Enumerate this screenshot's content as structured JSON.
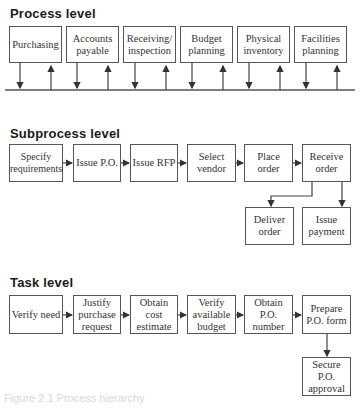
{
  "process_level": {
    "heading": "Process level",
    "boxes": [
      {
        "label": "Purchasing"
      },
      {
        "label": "Accounts payable"
      },
      {
        "label": "Receiving/ inspection"
      },
      {
        "label": "Budget planning"
      },
      {
        "label": "Physical inventory"
      },
      {
        "label": "Facilities planning"
      }
    ]
  },
  "subprocess_level": {
    "heading": "Subprocess level",
    "boxes": [
      {
        "label": "Specify requirements"
      },
      {
        "label": "Issue P.O."
      },
      {
        "label": "Issue RFP"
      },
      {
        "label": "Select vendor"
      },
      {
        "label": "Place order"
      },
      {
        "label": "Receive order"
      },
      {
        "label": "Deliver order"
      },
      {
        "label": "Issue payment"
      }
    ]
  },
  "task_level": {
    "heading": "Task level",
    "boxes": [
      {
        "label": "Verify need"
      },
      {
        "label": "Justify purchase request"
      },
      {
        "label": "Obtain cost estimate"
      },
      {
        "label": "Verify available budget"
      },
      {
        "label": "Obtain P.O. number"
      },
      {
        "label": "Prepare P.O. form"
      },
      {
        "label": "Secure P.O. approval"
      }
    ]
  },
  "caption": "Figure 2.1 Process hierarchy"
}
